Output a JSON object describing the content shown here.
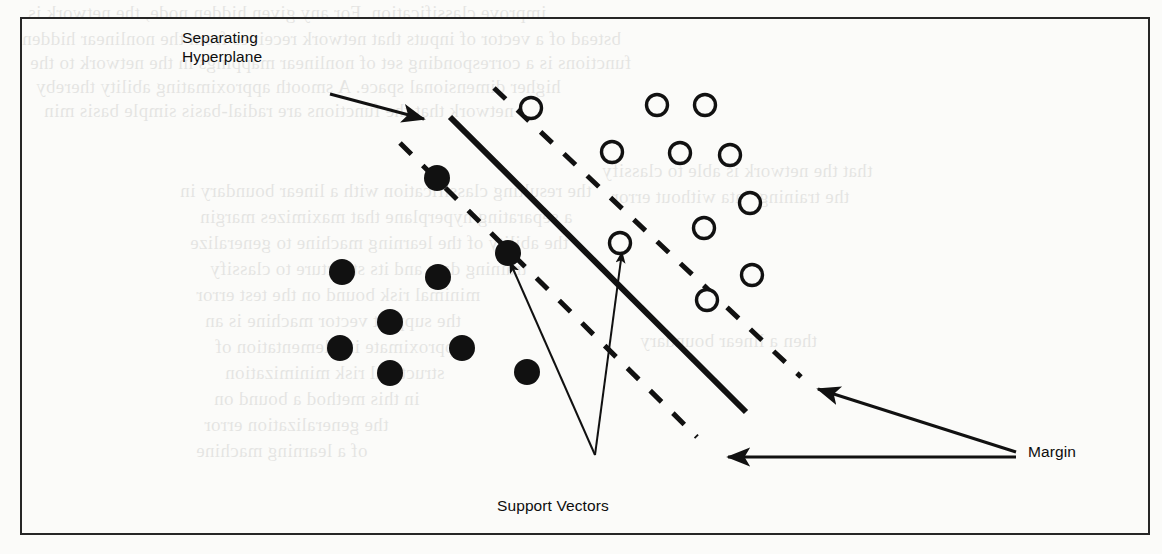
{
  "figure": {
    "kind": "svm-margin-diagram",
    "border_color": "#262626",
    "background_color": "#fbfbf9",
    "ink_color": "#111111"
  },
  "labels": {
    "separating_hyperplane": "Separating\nHyperplane",
    "margin": "Margin",
    "support_vectors": "Support Vectors"
  },
  "chart_data": {
    "type": "scatter",
    "title": "",
    "xlabel": "",
    "ylabel": "",
    "grid": false,
    "legend": "none",
    "annotations": [
      {
        "name": "separating-hyperplane",
        "text": "Separating Hyperplane",
        "x": 182,
        "y": 28
      },
      {
        "name": "margin",
        "text": "Margin",
        "x": 1028,
        "y": 442
      },
      {
        "name": "support-vectors",
        "text": "Support Vectors",
        "x": 497,
        "y": 496
      }
    ],
    "series": [
      {
        "name": "class-negative-filled",
        "marker": "filled-circle",
        "color": "#111111",
        "radius": 13,
        "points": [
          {
            "x": 437,
            "y": 178,
            "support_vector": true
          },
          {
            "x": 508,
            "y": 253,
            "support_vector": true
          },
          {
            "x": 342,
            "y": 272,
            "support_vector": false
          },
          {
            "x": 438,
            "y": 277,
            "support_vector": false
          },
          {
            "x": 390,
            "y": 322,
            "support_vector": false
          },
          {
            "x": 340,
            "y": 348,
            "support_vector": false
          },
          {
            "x": 462,
            "y": 348,
            "support_vector": false
          },
          {
            "x": 390,
            "y": 373,
            "support_vector": false
          },
          {
            "x": 527,
            "y": 372,
            "support_vector": false
          }
        ]
      },
      {
        "name": "class-positive-open",
        "marker": "open-circle",
        "color": "#111111",
        "radius": 13,
        "points": [
          {
            "x": 531,
            "y": 108,
            "support_vector": true
          },
          {
            "x": 657,
            "y": 105,
            "support_vector": false
          },
          {
            "x": 705,
            "y": 105,
            "support_vector": false
          },
          {
            "x": 612,
            "y": 152,
            "support_vector": false
          },
          {
            "x": 680,
            "y": 153,
            "support_vector": false
          },
          {
            "x": 730,
            "y": 155,
            "support_vector": false
          },
          {
            "x": 750,
            "y": 203,
            "support_vector": false
          },
          {
            "x": 620,
            "y": 243,
            "support_vector": true
          },
          {
            "x": 704,
            "y": 228,
            "support_vector": false
          },
          {
            "x": 752,
            "y": 275,
            "support_vector": false
          },
          {
            "x": 707,
            "y": 300,
            "support_vector": true
          }
        ]
      }
    ],
    "lines": [
      {
        "name": "separating-hyperplane",
        "style": "solid",
        "width": 6,
        "x1": 450,
        "y1": 117,
        "x2": 746,
        "y2": 412
      },
      {
        "name": "margin-boundary-upper",
        "style": "dashed",
        "width": 5,
        "x1": 494,
        "y1": 88,
        "x2": 801,
        "y2": 377
      },
      {
        "name": "margin-boundary-lower",
        "style": "dashed",
        "width": 5,
        "x1": 400,
        "y1": 143,
        "x2": 697,
        "y2": 437
      }
    ],
    "arrows": [
      {
        "name": "hyperplane-pointer",
        "from": [
          330,
          94
        ],
        "to": [
          424,
          119
        ],
        "width": 3
      },
      {
        "name": "support-vector-pointer-left",
        "from": [
          595,
          455
        ],
        "to": [
          510,
          262
        ],
        "width": 2
      },
      {
        "name": "support-vector-pointer-right",
        "from": [
          595,
          455
        ],
        "to": [
          622,
          252
        ],
        "width": 2
      },
      {
        "name": "margin-pointer-upper",
        "from": [
          1016,
          452
        ],
        "to": [
          818,
          389
        ],
        "width": 3
      },
      {
        "name": "margin-pointer-lower",
        "from": [
          1016,
          457
        ],
        "to": [
          728,
          457
        ],
        "width": 3
      }
    ]
  },
  "bleed_text": {
    "lines": [
      {
        "text": "improve classification. For any given hidden node, the network is",
        "x": 28,
        "y": 2
      },
      {
        "text": "bstead of a vector of inputs that network receives from the nonlinear hidden",
        "x": 22,
        "y": 28
      },
      {
        "text": "functions is a corresponding set of nonlinear mappings in the network to the",
        "x": 30,
        "y": 52
      },
      {
        "text": "higher dimensional space. A smooth approximating ability thereby",
        "x": 36,
        "y": 76
      },
      {
        "text": "network that the functions are radial-basis simple basis min",
        "x": 44,
        "y": 100
      },
      {
        "text": "the resulting classification with a linear boundary in",
        "x": 180,
        "y": 180
      },
      {
        "text": "a separating hyperplane that maximizes margin",
        "x": 200,
        "y": 206
      },
      {
        "text": "the ability of the learning machine to generalize",
        "x": 190,
        "y": 232
      },
      {
        "text": "training data and its structure to classify",
        "x": 210,
        "y": 258
      },
      {
        "text": "minimal risk bound on the test error",
        "x": 196,
        "y": 284
      },
      {
        "text": "the support vector machine is an",
        "x": 205,
        "y": 310
      },
      {
        "text": "approximate implementation of",
        "x": 215,
        "y": 336
      },
      {
        "text": "structural risk minimization",
        "x": 225,
        "y": 362
      },
      {
        "text": "in this method a bound on",
        "x": 214,
        "y": 388
      },
      {
        "text": "the generalization error",
        "x": 204,
        "y": 414
      },
      {
        "text": "of a learning machine",
        "x": 196,
        "y": 440
      },
      {
        "text": "that the network is able to classify",
        "x": 602,
        "y": 160
      },
      {
        "text": "the training data without error",
        "x": 612,
        "y": 186
      },
      {
        "text": "then a linear boundary",
        "x": 640,
        "y": 330
      }
    ]
  }
}
